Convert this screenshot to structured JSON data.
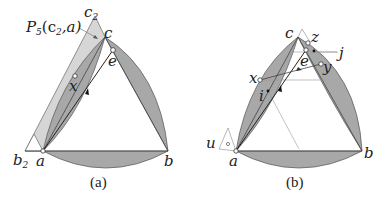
{
  "panels": [
    {
      "id": "a",
      "caption": "(a)",
      "labels": {
        "a": "a",
        "b": "b",
        "c": "c",
        "e": "e",
        "x": "x",
        "c2_base": "c",
        "c2_sub": "2",
        "b2_base": "b",
        "b2_sub": "2",
        "annotation": "P",
        "annotation_sub": "5",
        "annotation_args": "(c",
        "annotation_args_sub": "2",
        "annotation_tail": ",a)"
      }
    },
    {
      "id": "b",
      "caption": "(b)",
      "labels": {
        "a": "a",
        "b": "b",
        "c": "c",
        "e": "e",
        "x": "x",
        "y": "y",
        "z": "z",
        "j": "j",
        "i": "i",
        "u": "u"
      }
    }
  ],
  "colors": {
    "lens_fill": "#a9a9a9",
    "strip_fill": "#d4d4d4",
    "stroke": "#444444",
    "thin_line": "#999999"
  }
}
